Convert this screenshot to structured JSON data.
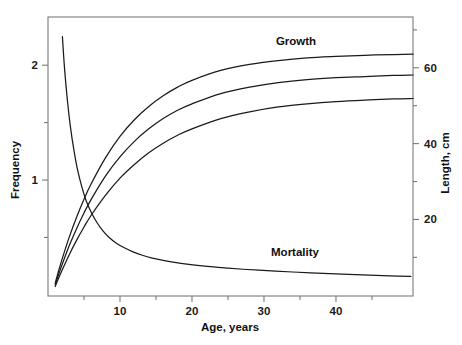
{
  "chart_data": {
    "type": "line",
    "title": "",
    "xlabel": "Age, years",
    "ylabel": "Frequency",
    "y2label": "Length, cm",
    "grid": false,
    "legend": "none",
    "xlim": [
      0,
      50.7
    ],
    "ylim": [
      -0.01,
      2.42
    ],
    "y2lim": [
      -0.2,
      73.4
    ],
    "xticks": [
      10,
      20,
      30,
      40
    ],
    "xticks_minor": [
      5,
      15,
      25,
      35,
      45
    ],
    "yticks": [
      1,
      2
    ],
    "yticks_minor": [
      0.5,
      1.5
    ],
    "y2ticks": [
      20,
      40,
      60
    ],
    "y2ticks_minor": [
      10,
      30,
      50,
      70
    ],
    "annotations": [
      {
        "text": "Growth",
        "x": 30.5,
        "y": 2.24,
        "axis": "left"
      },
      {
        "text": "Mortality",
        "x": 30.0,
        "y": 0.355,
        "axis": "left"
      }
    ],
    "series": [
      {
        "name": "Mortality",
        "axis": "left",
        "unit": "frequency",
        "x": [
          2.0,
          2.3,
          2.7,
          3.1,
          3.6,
          4.1,
          4.7,
          5.3,
          6.0,
          6.8,
          7.6,
          8.5,
          9.5,
          10.6,
          11.8,
          13.1,
          14.5,
          16.0,
          17.6,
          19.3,
          21.1,
          23.0,
          25.0,
          27.1,
          29.3,
          31.6,
          34.0,
          36.5,
          39.1,
          41.8,
          44.6,
          47.5,
          50.4
        ],
        "y": [
          2.25,
          1.97,
          1.69,
          1.47,
          1.26,
          1.09,
          0.94,
          0.82,
          0.72,
          0.63,
          0.56,
          0.5,
          0.45,
          0.41,
          0.375,
          0.345,
          0.32,
          0.3,
          0.283,
          0.268,
          0.255,
          0.243,
          0.233,
          0.223,
          0.215,
          0.207,
          0.199,
          0.192,
          0.185,
          0.179,
          0.172,
          0.166,
          0.16
        ]
      },
      {
        "name": "Growth upper",
        "axis": "right",
        "unit": "cm",
        "Linf": 62.0,
        "K": 0.115,
        "t0": 0.55,
        "x": [
          1.0,
          1.5,
          2.0,
          3.0,
          4.0,
          5.0,
          6.0,
          8.0,
          10.0,
          12.0,
          14.0,
          16.0,
          18.0,
          20.0,
          24.0,
          28.0,
          32.0,
          36.0,
          40.0,
          44.0,
          48.0,
          50.7
        ],
        "y": [
          3.2,
          6.6,
          9.8,
          15.6,
          20.7,
          25.3,
          29.4,
          36.3,
          41.9,
          46.3,
          49.8,
          52.6,
          54.9,
          56.7,
          59.3,
          60.9,
          61.9,
          62.6,
          63.0,
          63.3,
          63.5,
          63.6
        ]
      },
      {
        "name": "Growth middle",
        "axis": "right",
        "unit": "cm",
        "Linf": 58.0,
        "K": 0.105,
        "t0": 0.48,
        "x": [
          1.0,
          1.5,
          2.0,
          3.0,
          4.0,
          5.0,
          6.0,
          8.0,
          10.0,
          12.0,
          14.0,
          16.0,
          18.0,
          20.0,
          24.0,
          28.0,
          32.0,
          36.0,
          40.0,
          44.0,
          48.0,
          50.7
        ],
        "y": [
          2.8,
          5.6,
          8.3,
          13.3,
          17.7,
          21.7,
          25.3,
          31.5,
          36.5,
          40.6,
          43.9,
          46.6,
          48.8,
          50.5,
          53.2,
          54.9,
          56.1,
          56.9,
          57.4,
          57.7,
          58.0,
          58.1
        ]
      },
      {
        "name": "Growth lower",
        "axis": "right",
        "unit": "cm",
        "Linf": 52.0,
        "K": 0.095,
        "t0": 0.4,
        "x": [
          1.0,
          1.5,
          2.0,
          3.0,
          4.0,
          5.0,
          6.0,
          8.0,
          10.0,
          12.0,
          14.0,
          16.0,
          18.0,
          20.0,
          24.0,
          28.0,
          32.0,
          36.0,
          40.0,
          44.0,
          48.0,
          50.7
        ],
        "y": [
          2.3,
          4.6,
          6.8,
          10.9,
          14.6,
          18.0,
          21.1,
          26.4,
          30.9,
          34.5,
          37.6,
          40.1,
          42.2,
          43.9,
          46.6,
          48.4,
          49.7,
          50.5,
          51.1,
          51.5,
          51.8,
          51.9
        ]
      }
    ]
  },
  "axes": {
    "x_tick_labels": [
      "10",
      "20",
      "30",
      "40"
    ],
    "y_left_tick_labels": [
      "1",
      "2"
    ],
    "y_right_tick_labels": [
      "20",
      "40",
      "60"
    ],
    "x_title": "Age, years",
    "y_left_title": "Frequency",
    "y_right_title": "Length, cm"
  },
  "annotations": {
    "growth": "Growth",
    "mortality": "Mortality"
  },
  "colors": {
    "curve": "#1a1a1a",
    "axis": "#7a7a7a",
    "text": "#111111",
    "background": "#ffffff"
  }
}
